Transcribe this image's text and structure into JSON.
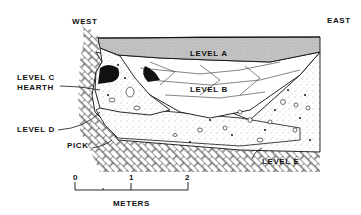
{
  "labels": {
    "west": "WEST",
    "east": "EAST",
    "level_a": "LEVEL A",
    "level_b": "LEVEL B",
    "level_c": "LEVEL C",
    "hearth": "HEARTH",
    "level_d": "LEVEL D",
    "pick": "PICK",
    "level_e": "LEVEL E"
  },
  "scale": {
    "ticks": [
      "0",
      "1",
      "2"
    ],
    "unit": "METERS"
  },
  "colors": {
    "ink": "#111111",
    "level_a_fill": "#bdbdbd",
    "background": "#ffffff"
  }
}
